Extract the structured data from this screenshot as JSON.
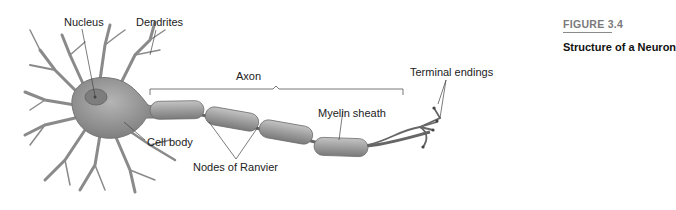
{
  "figure": {
    "number": "FIGURE 3.4",
    "title": "Structure of a Neuron"
  },
  "labels": {
    "nucleus": "Nucleus",
    "dendrites": "Dendrites",
    "axon": "Axon",
    "cell_body": "Cell body",
    "nodes_of_ranvier": "Nodes of Ranvier",
    "myelin_sheath": "Myelin sheath",
    "terminal_endings": "Terminal endings"
  },
  "colors": {
    "cell_fill": "#9a9a9a",
    "sheath_fill": "#a8a8a8",
    "line": "#555555",
    "text": "#222222"
  }
}
